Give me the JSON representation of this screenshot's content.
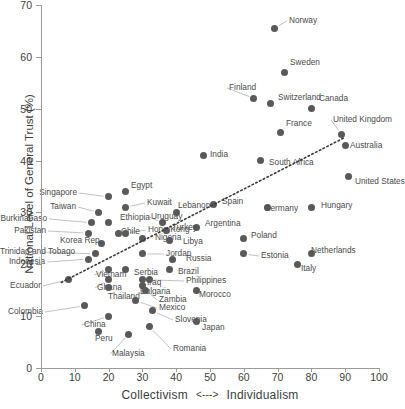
{
  "chart_data": {
    "type": "scatter",
    "title": "",
    "xlabel": "Collectivism  <--->  Individualism",
    "xlabel_left": "Collectivism",
    "xlabel_sep": "<--->",
    "xlabel_right": "Individualism",
    "ylabel": "National Level of General Trust (%)",
    "xlim": [
      0,
      100
    ],
    "ylim": [
      0,
      70
    ],
    "xticks": [
      0,
      10,
      20,
      30,
      40,
      50,
      60,
      70,
      80,
      90,
      100
    ],
    "yticks": [
      0,
      10,
      20,
      30,
      40,
      50,
      60,
      70
    ],
    "grid": false,
    "legend": "none",
    "marker_color": "#595959",
    "trendline": {
      "style": "dotted",
      "x0": 6,
      "y0": 16.5,
      "x1": 90,
      "y1": 44.5
    },
    "points": [
      {
        "label": "Norway",
        "x": 69,
        "y": 65.5,
        "lx": 289,
        "ly": 21,
        "anchor": "left"
      },
      {
        "label": "Sweden",
        "x": 72,
        "y": 57,
        "lx": 290,
        "ly": 63,
        "anchor": "left"
      },
      {
        "label": "Finland",
        "x": 63,
        "y": 52,
        "lx": 229,
        "ly": 88,
        "anchor": "left"
      },
      {
        "label": "Switzerland",
        "x": 68,
        "y": 51,
        "lx": 278,
        "ly": 98,
        "anchor": "left"
      },
      {
        "label": "Canada",
        "x": 80,
        "y": 50,
        "lx": 319,
        "ly": 99,
        "anchor": "left"
      },
      {
        "label": "France",
        "x": 71,
        "y": 45.5,
        "lx": 286,
        "ly": 124,
        "anchor": "left"
      },
      {
        "label": "United Kingdom",
        "x": 89,
        "y": 45,
        "lx": 333,
        "ly": 120,
        "anchor": "left"
      },
      {
        "label": "Australia",
        "x": 90,
        "y": 43,
        "lx": 350,
        "ly": 146,
        "anchor": "left"
      },
      {
        "label": "India",
        "x": 48,
        "y": 41,
        "lx": 210,
        "ly": 155,
        "anchor": "left"
      },
      {
        "label": "South Africa",
        "x": 65,
        "y": 40,
        "lx": 269,
        "ly": 163,
        "anchor": "left"
      },
      {
        "label": "United States",
        "x": 91,
        "y": 37,
        "lx": 355,
        "ly": 182,
        "anchor": "left"
      },
      {
        "label": "Egypt",
        "x": 25,
        "y": 34,
        "lx": 131,
        "ly": 186,
        "anchor": "left"
      },
      {
        "label": "Singapore",
        "x": 20,
        "y": 33,
        "lx": 77,
        "ly": 193,
        "anchor": "right"
      },
      {
        "label": "Spain",
        "x": 51,
        "y": 31.5,
        "lx": 222,
        "ly": 202,
        "anchor": "left"
      },
      {
        "label": "Germany",
        "x": 67,
        "y": 31,
        "lx": 264,
        "ly": 209,
        "anchor": "left"
      },
      {
        "label": "Hungary",
        "x": 80,
        "y": 31,
        "lx": 321,
        "ly": 206,
        "anchor": "left"
      },
      {
        "label": "Kuwait",
        "x": 25,
        "y": 31,
        "lx": 147,
        "ly": 203,
        "anchor": "left"
      },
      {
        "label": "Taiwan",
        "x": 17,
        "y": 30,
        "lx": 76,
        "ly": 207,
        "anchor": "right"
      },
      {
        "label": "Lebanon",
        "x": 40,
        "y": 30,
        "lx": 178,
        "ly": 206,
        "anchor": "left"
      },
      {
        "label": "BurkinaFaso",
        "x": 15,
        "y": 28,
        "lx": 47,
        "ly": 219,
        "anchor": "right"
      },
      {
        "label": "Ethiopia",
        "x": 20,
        "y": 28,
        "lx": 120,
        "ly": 218,
        "anchor": "left"
      },
      {
        "label": "Uruguay",
        "x": 36,
        "y": 28,
        "lx": 151,
        "ly": 217,
        "anchor": "left"
      },
      {
        "label": "Argentina",
        "x": 46,
        "y": 27,
        "lx": 205,
        "ly": 224,
        "anchor": "left"
      },
      {
        "label": "Pakistan",
        "x": 14,
        "y": 26,
        "lx": 46,
        "ly": 231,
        "anchor": "right"
      },
      {
        "label": "Chile",
        "x": 23,
        "y": 26,
        "lx": 121,
        "ly": 232,
        "anchor": "left"
      },
      {
        "label": "Hong Kong",
        "x": 25,
        "y": 26,
        "lx": 148,
        "ly": 230,
        "anchor": "left"
      },
      {
        "label": "Poland",
        "x": 60,
        "y": 25,
        "lx": 251,
        "ly": 236,
        "anchor": "left"
      },
      {
        "label": "Korea Rep.",
        "x": 18,
        "y": 24,
        "lx": 102,
        "ly": 241,
        "anchor": "right"
      },
      {
        "label": "Nigeria",
        "x": 30,
        "y": 25,
        "lx": 155,
        "ly": 238,
        "anchor": "left"
      },
      {
        "label": "Libya",
        "x": 38,
        "y": 24.5,
        "lx": 183,
        "ly": 242,
        "anchor": "left"
      },
      {
        "label": "Turkey",
        "x": 37,
        "y": 26.5,
        "lx": 172,
        "ly": 228,
        "anchor": "left"
      },
      {
        "label": "Trinidad and Tobago",
        "x": 16,
        "y": 22,
        "lx": 40,
        "ly": 252,
        "anchor": "right"
      },
      {
        "label": "Netherlands",
        "x": 80,
        "y": 22,
        "lx": 311,
        "ly": 251,
        "anchor": "left"
      },
      {
        "label": "Jordan",
        "x": 30,
        "y": 22,
        "lx": 166,
        "ly": 254,
        "anchor": "left"
      },
      {
        "label": "Estonia",
        "x": 60,
        "y": 22,
        "lx": 261,
        "ly": 256,
        "anchor": "left"
      },
      {
        "label": "Indonesia",
        "x": 14,
        "y": 21,
        "lx": 45,
        "ly": 262,
        "anchor": "right"
      },
      {
        "label": "Russia",
        "x": 39,
        "y": 21,
        "lx": 186,
        "ly": 259,
        "anchor": "left"
      },
      {
        "label": "Italy",
        "x": 76,
        "y": 20,
        "lx": 301,
        "ly": 269,
        "anchor": "left"
      },
      {
        "label": "Vietnam",
        "x": 20,
        "y": 19,
        "lx": 96,
        "ly": 275,
        "anchor": "left"
      },
      {
        "label": "Serbia",
        "x": 25,
        "y": 19,
        "lx": 134,
        "ly": 273,
        "anchor": "left"
      },
      {
        "label": "Brazil",
        "x": 38,
        "y": 19,
        "lx": 178,
        "ly": 272,
        "anchor": "left"
      },
      {
        "label": "Ecuador",
        "x": 8,
        "y": 17,
        "lx": 41,
        "ly": 286,
        "anchor": "right"
      },
      {
        "label": "Ghana",
        "x": 20,
        "y": 17,
        "lx": 97,
        "ly": 288,
        "anchor": "left"
      },
      {
        "label": "Iraq",
        "x": 30,
        "y": 17,
        "lx": 147,
        "ly": 283,
        "anchor": "left"
      },
      {
        "label": "Philippines",
        "x": 32,
        "y": 17,
        "lx": 186,
        "ly": 281,
        "anchor": "left"
      },
      {
        "label": "Thailand",
        "x": 20,
        "y": 15.5,
        "lx": 108,
        "ly": 297,
        "anchor": "left"
      },
      {
        "label": "Bulgaria",
        "x": 30,
        "y": 16,
        "lx": 140,
        "ly": 292,
        "anchor": "left"
      },
      {
        "label": "Zambia",
        "x": 31,
        "y": 15,
        "lx": 159,
        "ly": 300,
        "anchor": "left"
      },
      {
        "label": "Morocco",
        "x": 46,
        "y": 15,
        "lx": 199,
        "ly": 295,
        "anchor": "left"
      },
      {
        "label": "Colombia",
        "x": 13,
        "y": 12,
        "lx": 43,
        "ly": 312,
        "anchor": "right"
      },
      {
        "label": "Mexico",
        "x": 28,
        "y": 13,
        "lx": 159,
        "ly": 308,
        "anchor": "left"
      },
      {
        "label": "China",
        "x": 20,
        "y": 10,
        "lx": 84,
        "ly": 325,
        "anchor": "left"
      },
      {
        "label": "Slovenia",
        "x": 33,
        "y": 11,
        "lx": 175,
        "ly": 320,
        "anchor": "left"
      },
      {
        "label": "Japan",
        "x": 46,
        "y": 9,
        "lx": 202,
        "ly": 328,
        "anchor": "left"
      },
      {
        "label": "Peru",
        "x": 17,
        "y": 7,
        "lx": 95,
        "ly": 339,
        "anchor": "left"
      },
      {
        "label": "Malaysia",
        "x": 26,
        "y": 6.5,
        "lx": 112,
        "ly": 354,
        "anchor": "left"
      },
      {
        "label": "Romania",
        "x": 32,
        "y": 8,
        "lx": 173,
        "ly": 349,
        "anchor": "left"
      }
    ]
  }
}
